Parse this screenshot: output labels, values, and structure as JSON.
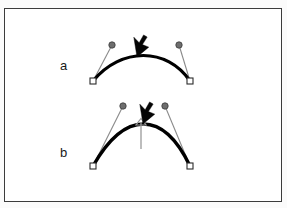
{
  "figure": {
    "title": "",
    "frame": {
      "x": 4,
      "y": 8,
      "width": 278,
      "height": 194,
      "border_color": "#3c3c3c",
      "background": "#ffffff"
    },
    "labels": [
      {
        "id": "a",
        "text": "a",
        "x": 60,
        "y": 59
      },
      {
        "id": "b",
        "text": "b",
        "x": 60,
        "y": 146
      }
    ],
    "colors": {
      "curve": "#000000",
      "handle_line": "#8a8a8a",
      "control_dot_fill": "#6e6e6e",
      "control_dot_stroke": "#3a3a3a",
      "anchor_fill": "#ffffff",
      "anchor_stroke": "#2b2b2b",
      "cursor": "#050505",
      "drag_arrow": "#9a9a9a"
    },
    "panels": [
      {
        "id": "a",
        "description": "Bezier curve with shallow arc, both handles pulled outward and upward, mouse cursor resting on the curve apex",
        "curve": {
          "type": "cubic-bezier",
          "start": {
            "x": 93,
            "y": 81
          },
          "control1": {
            "x": 121,
            "y": 47
          },
          "control2": {
            "x": 167,
            "y": 47
          },
          "end": {
            "x": 190,
            "y": 81
          },
          "stroke_width": 3.2
        },
        "anchors": [
          {
            "name": "start-anchor",
            "x": 93,
            "y": 81,
            "size": 6
          },
          {
            "name": "end-anchor",
            "x": 190,
            "y": 81,
            "size": 6
          }
        ],
        "handles": [
          {
            "name": "handle-left",
            "from": {
              "x": 93,
              "y": 81
            },
            "to": {
              "x": 112,
              "y": 45
            },
            "dot_radius": 3.2
          },
          {
            "name": "handle-right",
            "from": {
              "x": 190,
              "y": 81
            },
            "to": {
              "x": 179,
              "y": 45
            },
            "dot_radius": 3.2
          }
        ],
        "cursor": {
          "name": "mouse-pointer",
          "x": 137,
          "y": 57,
          "rotation": -118,
          "length": 20
        },
        "drag_arrow": null
      },
      {
        "id": "b",
        "description": "Same Bezier curve after the apex was dragged upward, producing a taller peak; a thin vertical drag arrow points up at the apex and the mouse cursor sits beside it",
        "curve": {
          "type": "cubic-bezier",
          "start": {
            "x": 93,
            "y": 166
          },
          "control1": {
            "x": 125,
            "y": 110
          },
          "control2": {
            "x": 163,
            "y": 110
          },
          "end": {
            "x": 190,
            "y": 166
          },
          "stroke_width": 3.4
        },
        "anchors": [
          {
            "name": "start-anchor",
            "x": 93,
            "y": 166,
            "size": 6
          },
          {
            "name": "end-anchor",
            "x": 190,
            "y": 166,
            "size": 6
          }
        ],
        "handles": [
          {
            "name": "handle-left",
            "from": {
              "x": 93,
              "y": 166
            },
            "to": {
              "x": 123,
              "y": 106
            },
            "dot_radius": 3.2
          },
          {
            "name": "handle-right",
            "from": {
              "x": 190,
              "y": 166
            },
            "to": {
              "x": 165,
              "y": 106
            },
            "dot_radius": 3.2
          }
        ],
        "cursor": {
          "name": "mouse-pointer",
          "x": 143,
          "y": 124,
          "rotation": -118,
          "length": 20
        },
        "drag_arrow": {
          "name": "drag-up-arrow",
          "x": 141,
          "y_tail": 149,
          "y_head": 119,
          "head_width": 5,
          "stroke_width": 1.2
        }
      }
    ]
  }
}
